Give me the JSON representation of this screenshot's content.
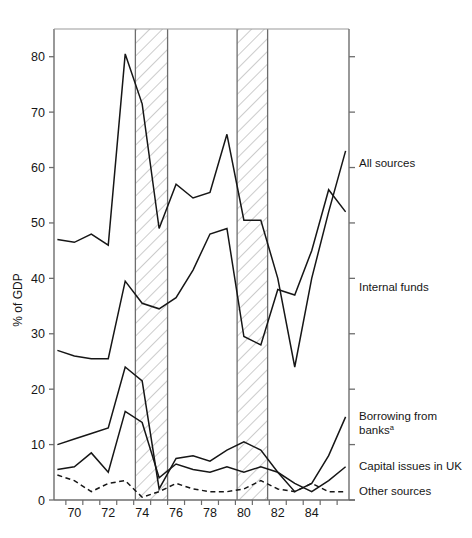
{
  "figure": {
    "ghost_title": "",
    "background": "#ffffff",
    "ink": "#161616"
  },
  "axes": {
    "y_title": "% of GDP",
    "y_ticks": [
      0,
      10,
      20,
      30,
      40,
      50,
      60,
      70,
      80
    ],
    "y_tick_labels": [
      "0",
      "10",
      "20",
      "30",
      "40",
      "50",
      "60",
      "70",
      "80"
    ],
    "x_tick_labels": [
      "70",
      "72",
      "74",
      "76",
      "78",
      "80",
      "82",
      "84"
    ],
    "x_tick_years": [
      1970,
      1972,
      1974,
      1976,
      1978,
      1980,
      1982,
      1984
    ]
  },
  "legend": {
    "position": "right-of-plot",
    "items": [
      {
        "label": "All sources",
        "style": "solid",
        "at_value": 63
      },
      {
        "label": "Internal funds",
        "style": "solid",
        "at_value": 40
      },
      {
        "label": "Borrowing from",
        "label2": "banks",
        "footnote": "a",
        "style": "solid",
        "at_value": 15
      },
      {
        "label": "Capital issues in UK",
        "style": "solid",
        "at_value": 6
      },
      {
        "label": "Other sources",
        "style": "dashed",
        "at_value": 2
      }
    ]
  },
  "shaded_bands": [
    {
      "name": "recession-band-1",
      "start": 1973.6,
      "end": 1975.5,
      "hatch": "diagonal"
    },
    {
      "name": "recession-band-2",
      "start": 1979.6,
      "end": 1981.4,
      "hatch": "diagonal"
    }
  ],
  "chart_data": {
    "type": "line",
    "title": "",
    "xlabel": "",
    "ylabel": "% of GDP",
    "xlim": [
      1968.8,
      1986.2
    ],
    "ylim": [
      0,
      85
    ],
    "grid": false,
    "legend_position": "right",
    "x": [
      1969,
      1970,
      1971,
      1972,
      1973,
      1974,
      1975,
      1976,
      1977,
      1978,
      1979,
      1980,
      1981,
      1982,
      1983,
      1984,
      1985,
      1986
    ],
    "series": [
      {
        "name": "All sources",
        "style": "solid",
        "values": [
          47.0,
          46.5,
          48.0,
          46.0,
          80.5,
          71.5,
          49.0,
          57.0,
          54.5,
          55.5,
          66.0,
          50.5,
          50.5,
          40.0,
          24.0,
          40.0,
          52.0,
          63.0
        ]
      },
      {
        "name": "Internal funds",
        "style": "solid",
        "values": [
          27.0,
          26.0,
          25.5,
          25.5,
          39.5,
          35.5,
          34.5,
          36.5,
          41.5,
          48.0,
          49.0,
          29.5,
          28.0,
          38.0,
          37.0,
          45.0,
          56.0,
          52.0
        ]
      },
      {
        "name": "Borrowing from banks",
        "style": "solid",
        "values": [
          10.0,
          11.0,
          12.0,
          13.0,
          24.0,
          21.5,
          2.0,
          7.5,
          8.0,
          7.0,
          9.0,
          10.5,
          9.0,
          5.0,
          1.5,
          3.0,
          8.0,
          15.0
        ]
      },
      {
        "name": "Capital issues in UK",
        "style": "solid",
        "values": [
          5.5,
          6.0,
          8.5,
          5.0,
          16.0,
          14.0,
          4.0,
          6.5,
          5.5,
          5.0,
          6.0,
          5.0,
          6.0,
          5.0,
          3.0,
          1.5,
          3.5,
          6.0
        ]
      },
      {
        "name": "Other sources",
        "style": "dashed",
        "values": [
          4.5,
          3.5,
          1.5,
          3.0,
          3.5,
          0.5,
          1.5,
          3.0,
          2.0,
          1.5,
          1.5,
          2.0,
          3.5,
          2.0,
          1.5,
          3.0,
          1.5,
          1.5
        ]
      }
    ]
  }
}
